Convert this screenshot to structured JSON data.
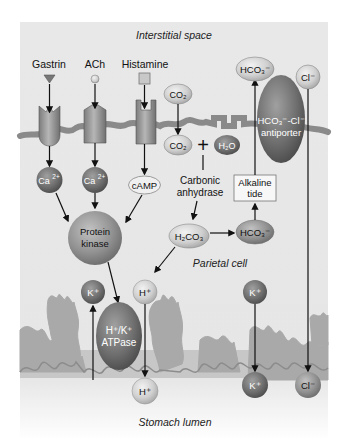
{
  "diagram": {
    "regions": {
      "top": "Interstitial space",
      "middle": "Parietal cell",
      "bottom": "Stomach lumen"
    },
    "stimuli": {
      "gastrin": "Gastrin",
      "ach": "ACh",
      "histamine": "Histamine"
    },
    "second_messengers": {
      "ca1": "Ca",
      "ca2": "Ca",
      "ca_sup": "2+",
      "camp": "cAMP"
    },
    "enzymes": {
      "protein_kinase_line1": "Protein",
      "protein_kinase_line2": "kinase",
      "carbonic_anhydrase_line1": "Carbonic",
      "carbonic_anhydrase_line2": "anhydrase",
      "atpase_line1": "H⁺/K⁺",
      "atpase_line2": "ATPase",
      "antiporter_line1": "HCO₃⁻-Cl⁻",
      "antiporter_line2": "antiporter"
    },
    "molecules": {
      "co2_out": "CO₂",
      "co2_in": "CO₂",
      "h2o": "H₂O",
      "h2co3": "H₂CO₃",
      "hco3_in": "HCO₃⁻",
      "hco3_out": "HCO₃⁻",
      "cl_out": "Cl⁻",
      "cl_lumen": "Cl⁻",
      "k_in_left": "K⁺",
      "h_in": "H⁺",
      "h_lumen": "H⁺",
      "k_in_right": "K⁺",
      "k_lumen": "K⁺",
      "plus_sign": "+"
    },
    "boxes": {
      "alkaline_tide_line1": "Alkaline",
      "alkaline_tide_line2": "tide"
    },
    "colors": {
      "panel_bg": "#e9e9e9",
      "membrane": "#8f8f8f",
      "lumen_fold": "#a8a8a8",
      "dark_ball": "#6e6e6e",
      "light_ball": "#c9c9c9",
      "arrow": "#111111"
    }
  }
}
